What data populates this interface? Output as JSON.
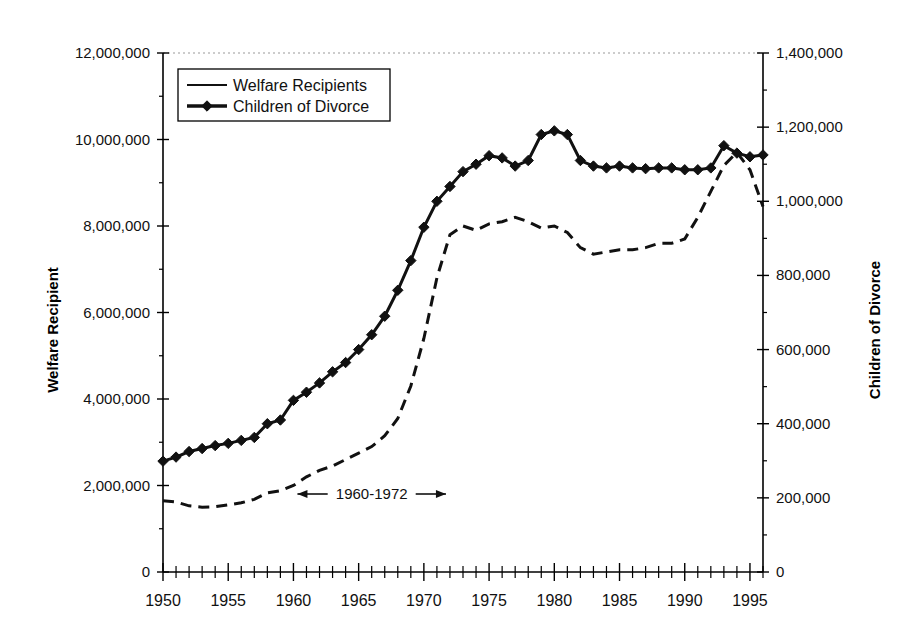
{
  "chart_data": {
    "type": "line",
    "title": "",
    "xlabel": "",
    "xlim": [
      1950,
      1996
    ],
    "x_tick_labels": [
      "1950",
      "1955",
      "1960",
      "1965",
      "1970",
      "1975",
      "1980",
      "1985",
      "1990",
      "1995"
    ],
    "x_tick_values": [
      1950,
      1955,
      1960,
      1965,
      1970,
      1975,
      1980,
      1985,
      1990,
      1995
    ],
    "x_minor_tick_step": 1,
    "grid": false,
    "legend_position": "top-left",
    "axes": [
      {
        "id": "left",
        "label": "Welfare Recipient",
        "lim": [
          0,
          12000000
        ],
        "tick_values": [
          0,
          2000000,
          4000000,
          6000000,
          8000000,
          10000000,
          12000000
        ],
        "tick_labels": [
          "0",
          "2,000,000",
          "4,000,000",
          "6,000,000",
          "8,000,000",
          "10,000,000",
          "12,000,000"
        ]
      },
      {
        "id": "right",
        "label": "Children of Divorce",
        "lim": [
          0,
          1400000
        ],
        "tick_values": [
          0,
          200000,
          400000,
          600000,
          800000,
          1000000,
          1200000,
          1400000
        ],
        "tick_labels": [
          "0",
          "200,000",
          "400,000",
          "600,000",
          "800,000",
          "1,000,000",
          "1,200,000",
          "1,400,000"
        ]
      }
    ],
    "series": [
      {
        "name": "Welfare Recipients",
        "axis": "left",
        "style": "dashed",
        "marker": "none",
        "x": [
          1950,
          1951,
          1952,
          1953,
          1954,
          1955,
          1956,
          1957,
          1958,
          1959,
          1960,
          1961,
          1962,
          1963,
          1964,
          1965,
          1966,
          1967,
          1968,
          1969,
          1970,
          1971,
          1972,
          1973,
          1974,
          1975,
          1976,
          1977,
          1978,
          1979,
          1980,
          1981,
          1982,
          1983,
          1984,
          1985,
          1986,
          1987,
          1988,
          1989,
          1990,
          1991,
          1992,
          1993,
          1994,
          1995,
          1996
        ],
        "values": [
          1650000,
          1620000,
          1530000,
          1500000,
          1510000,
          1550000,
          1600000,
          1680000,
          1830000,
          1880000,
          2000000,
          2200000,
          2350000,
          2450000,
          2600000,
          2750000,
          2900000,
          3150000,
          3550000,
          4300000,
          5400000,
          6800000,
          7800000,
          8000000,
          7900000,
          8050000,
          8100000,
          8200000,
          8100000,
          7950000,
          8000000,
          7850000,
          7500000,
          7350000,
          7400000,
          7450000,
          7450000,
          7500000,
          7600000,
          7600000,
          7700000,
          8200000,
          8800000,
          9400000,
          9700000,
          9300000,
          8450000
        ]
      },
      {
        "name": "Children of Divorce",
        "axis": "right",
        "style": "solid",
        "marker": "diamond",
        "x": [
          1950,
          1951,
          1952,
          1953,
          1954,
          1955,
          1956,
          1957,
          1958,
          1959,
          1960,
          1961,
          1962,
          1963,
          1964,
          1965,
          1966,
          1967,
          1968,
          1969,
          1970,
          1971,
          1972,
          1973,
          1974,
          1975,
          1976,
          1977,
          1978,
          1979,
          1980,
          1981,
          1982,
          1983,
          1984,
          1985,
          1986,
          1987,
          1988,
          1989,
          1990,
          1991,
          1992,
          1993,
          1994,
          1995,
          1996
        ],
        "values": [
          299000,
          310000,
          325000,
          333000,
          341000,
          347000,
          355000,
          363000,
          400000,
          410000,
          463000,
          485000,
          510000,
          540000,
          565000,
          600000,
          640000,
          690000,
          760000,
          840000,
          930000,
          1000000,
          1040000,
          1080000,
          1100000,
          1123000,
          1117000,
          1095000,
          1110000,
          1180000,
          1190000,
          1180000,
          1110000,
          1095000,
          1090000,
          1095000,
          1090000,
          1088000,
          1090000,
          1090000,
          1085000,
          1085000,
          1090000,
          1150000,
          1130000,
          1120000,
          1125000
        ]
      }
    ],
    "annotations": [
      {
        "id": "period-bracket",
        "text": "1960-1972",
        "x_start": 1960,
        "x_end": 1972,
        "arrow": "double"
      },
      {
        "id": "vline-1960",
        "x": 1960
      },
      {
        "id": "vline-1972",
        "x": 1972
      }
    ]
  },
  "legend": {
    "items": [
      {
        "label": "Welfare Recipients",
        "marker": "dash-line"
      },
      {
        "label": "Children of Divorce",
        "marker": "diamond-line"
      }
    ]
  },
  "colors": {
    "line": "#111111",
    "axis": "#000000",
    "background": "#ffffff",
    "grid": "#999999"
  }
}
